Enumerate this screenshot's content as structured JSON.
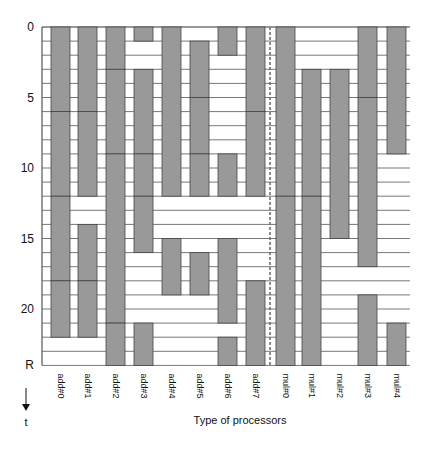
{
  "chart_data": {
    "type": "gantt",
    "title": "",
    "xlabel": "Type of processors",
    "ylabel": "t",
    "y_axis": {
      "ticks": [
        0,
        5,
        10,
        15,
        20
      ],
      "end_label": "R",
      "range": [
        0,
        24
      ],
      "direction": "down"
    },
    "categories": [
      "add#0",
      "add#1",
      "add#2",
      "add#3",
      "add#4",
      "add#5",
      "add#6",
      "add#7",
      "mul#0",
      "mul#1",
      "mul#2",
      "mul#3",
      "mul#4"
    ],
    "bars": [
      {
        "proc": "add#0",
        "segments": [
          [
            0,
            6
          ],
          [
            6,
            12
          ],
          [
            12,
            18
          ],
          [
            18,
            22
          ]
        ]
      },
      {
        "proc": "add#1",
        "segments": [
          [
            0,
            6
          ],
          [
            6,
            12
          ],
          [
            14,
            18
          ],
          [
            18,
            22
          ]
        ]
      },
      {
        "proc": "add#2",
        "segments": [
          [
            0,
            3
          ],
          [
            3,
            9
          ],
          [
            9,
            21
          ],
          [
            21,
            24
          ]
        ]
      },
      {
        "proc": "add#3",
        "segments": [
          [
            0,
            1
          ],
          [
            3,
            9
          ],
          [
            9,
            12
          ],
          [
            12,
            16
          ],
          [
            21,
            24
          ]
        ]
      },
      {
        "proc": "add#4",
        "segments": [
          [
            0,
            12
          ],
          [
            15,
            19
          ]
        ]
      },
      {
        "proc": "add#5",
        "segments": [
          [
            1,
            5
          ],
          [
            5,
            9
          ],
          [
            9,
            12
          ],
          [
            16,
            19
          ]
        ]
      },
      {
        "proc": "add#6",
        "segments": [
          [
            0,
            2
          ],
          [
            9,
            12
          ],
          [
            15,
            21
          ],
          [
            22,
            24
          ]
        ]
      },
      {
        "proc": "add#7",
        "segments": [
          [
            0,
            6
          ],
          [
            6,
            12
          ],
          [
            18,
            24
          ]
        ]
      },
      {
        "proc": "mul#0",
        "segments": [
          [
            0,
            12
          ],
          [
            12,
            24
          ]
        ]
      },
      {
        "proc": "mul#1",
        "segments": [
          [
            3,
            12
          ],
          [
            12,
            24
          ]
        ]
      },
      {
        "proc": "mul#2",
        "segments": [
          [
            3,
            15
          ]
        ]
      },
      {
        "proc": "mul#3",
        "segments": [
          [
            0,
            5
          ],
          [
            5,
            17
          ],
          [
            19,
            24
          ]
        ]
      },
      {
        "proc": "mul#4",
        "segments": [
          [
            0,
            9
          ],
          [
            21,
            24
          ]
        ]
      }
    ],
    "divider_after": "add#7",
    "colors": {
      "bar": "#999999",
      "bar_edge": "#444444",
      "grid": "#555555",
      "divider": "#666666"
    }
  }
}
